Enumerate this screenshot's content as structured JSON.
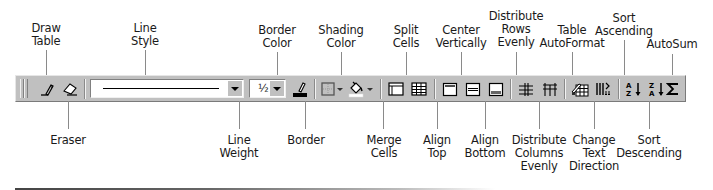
{
  "toolbar_name": "Tables and Borders",
  "line_style": {
    "value": "solid-line"
  },
  "line_weight": {
    "value": "½"
  },
  "colors": {
    "toolbar_bg": "#c0c0c0",
    "border_color_swatch": "#000000",
    "shading_color_swatch": "#ffffff"
  },
  "buttons": [
    {
      "id": "draw-table",
      "icon": "pencil-icon"
    },
    {
      "id": "eraser",
      "icon": "eraser-icon"
    },
    {
      "id": "line-style",
      "icon": "line-style-dropdown"
    },
    {
      "id": "line-weight",
      "icon": "line-weight-dropdown"
    },
    {
      "id": "border-color",
      "icon": "border-color-icon"
    },
    {
      "id": "border",
      "icon": "border-grid-icon"
    },
    {
      "id": "shading-color",
      "icon": "paint-bucket-icon"
    },
    {
      "id": "merge-cells",
      "icon": "merge-cells-icon"
    },
    {
      "id": "split-cells",
      "icon": "split-cells-icon"
    },
    {
      "id": "align-top",
      "icon": "align-top-icon"
    },
    {
      "id": "center-vertically",
      "icon": "center-vertically-icon"
    },
    {
      "id": "align-bottom",
      "icon": "align-bottom-icon"
    },
    {
      "id": "distribute-rows",
      "icon": "distribute-rows-icon"
    },
    {
      "id": "distribute-columns",
      "icon": "distribute-columns-icon"
    },
    {
      "id": "table-autoformat",
      "icon": "table-autoformat-icon"
    },
    {
      "id": "change-text-direction",
      "icon": "text-direction-icon"
    },
    {
      "id": "sort-ascending",
      "icon": "sort-az-icon"
    },
    {
      "id": "sort-descending",
      "icon": "sort-za-icon"
    },
    {
      "id": "autosum",
      "icon": "sigma-icon"
    }
  ],
  "labels_top": {
    "draw_table": [
      "Draw",
      "Table"
    ],
    "line_style": [
      "Line",
      "Style"
    ],
    "border_color": [
      "Border",
      "Color"
    ],
    "shading_color": [
      "Shading",
      "Color"
    ],
    "split_cells": [
      "Split",
      "Cells"
    ],
    "center_vertically": [
      "Center",
      "Vertically"
    ],
    "distribute_rows": [
      "Distribute",
      "Rows",
      "Evenly"
    ],
    "table_autoformat": [
      "Table",
      "AutoFormat"
    ],
    "sort_ascending": [
      "Sort",
      "Ascending"
    ],
    "autosum": [
      "AutoSum"
    ]
  },
  "labels_bottom": {
    "eraser": [
      "Eraser"
    ],
    "line_weight": [
      "Line",
      "Weight"
    ],
    "border": [
      "Border"
    ],
    "merge_cells": [
      "Merge",
      "Cells"
    ],
    "align_top": [
      "Align",
      "Top"
    ],
    "align_bottom": [
      "Align",
      "Bottom"
    ],
    "distribute_columns": [
      "Distribute",
      "Columns",
      "Evenly"
    ],
    "change_text_direction": [
      "Change",
      "Text",
      "Direction"
    ],
    "sort_descending": [
      "Sort",
      "Descending"
    ]
  }
}
